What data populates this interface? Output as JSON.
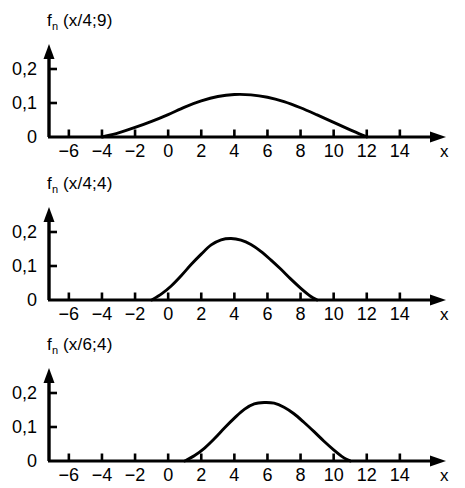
{
  "figure": {
    "background_color": "#ffffff",
    "ink_color": "#000000",
    "x_axis_name": "x",
    "panel_count": 3
  },
  "chart_data": [
    {
      "type": "line",
      "title": "f_n (x/4;9)",
      "title_base": "f",
      "title_sub": "n",
      "title_args": " (x/4;9)",
      "xlabel": "x",
      "ylabel": "",
      "xlim": [
        -7.2,
        15.6
      ],
      "ylim": [
        0,
        0.26
      ],
      "xticks": [
        -6,
        -4,
        -2,
        0,
        2,
        4,
        6,
        8,
        10,
        12,
        14
      ],
      "xtick_labels": [
        "−6",
        "−4",
        "−2",
        "0",
        "2",
        "4",
        "6",
        "8",
        "10",
        "12",
        "14"
      ],
      "yticks": [
        0,
        0.1,
        0.2
      ],
      "ytick_labels": [
        "0",
        "0,1",
        "0,2"
      ],
      "grid": false,
      "legend": "none",
      "peak_x": 4.2,
      "peak_y": 0.125,
      "support": [
        -4,
        12
      ],
      "x": [
        -4.0,
        -3.0,
        -2.0,
        -1.0,
        0.0,
        1.0,
        2.0,
        3.0,
        4.0,
        5.0,
        6.0,
        7.0,
        8.0,
        9.0,
        10.0,
        11.0,
        12.0
      ],
      "values": [
        0.0,
        0.012,
        0.028,
        0.046,
        0.066,
        0.088,
        0.106,
        0.119,
        0.125,
        0.124,
        0.117,
        0.104,
        0.086,
        0.065,
        0.043,
        0.021,
        0.0
      ]
    },
    {
      "type": "line",
      "title": "f_n (x/4;4)",
      "title_base": "f",
      "title_sub": "n",
      "title_args": " (x/4;4)",
      "xlabel": "x",
      "ylabel": "",
      "xlim": [
        -7.2,
        15.6
      ],
      "ylim": [
        0,
        0.26
      ],
      "xticks": [
        -6,
        -4,
        -2,
        0,
        2,
        4,
        6,
        8,
        10,
        12,
        14
      ],
      "xtick_labels": [
        "−6",
        "−4",
        "−2",
        "0",
        "2",
        "4",
        "6",
        "8",
        "10",
        "12",
        "14"
      ],
      "yticks": [
        0,
        0.1,
        0.2
      ],
      "ytick_labels": [
        "0",
        "0,1",
        "0,2"
      ],
      "grid": false,
      "legend": "none",
      "peak_x": 3.8,
      "peak_y": 0.181,
      "support": [
        -1,
        9
      ],
      "x": [
        -1.0,
        -0.4,
        0.2,
        0.8,
        1.4,
        2.0,
        2.6,
        3.2,
        3.8,
        4.4,
        5.0,
        5.6,
        6.2,
        6.8,
        7.4,
        8.0,
        8.6,
        9.0
      ],
      "values": [
        0.0,
        0.018,
        0.042,
        0.072,
        0.105,
        0.135,
        0.162,
        0.177,
        0.181,
        0.176,
        0.163,
        0.143,
        0.118,
        0.091,
        0.062,
        0.035,
        0.011,
        0.0
      ]
    },
    {
      "type": "line",
      "title": "f_n (x/6;4)",
      "title_base": "f",
      "title_sub": "n",
      "title_args": " (x/6;4)",
      "xlabel": "x",
      "ylabel": "",
      "xlim": [
        -7.2,
        15.6
      ],
      "ylim": [
        0,
        0.26
      ],
      "xticks": [
        -6,
        -4,
        -2,
        0,
        2,
        4,
        6,
        8,
        10,
        12,
        14
      ],
      "xtick_labels": [
        "−6",
        "−4",
        "−2",
        "0",
        "2",
        "4",
        "6",
        "8",
        "10",
        "12",
        "14"
      ],
      "yticks": [
        0,
        0.1,
        0.2
      ],
      "ytick_labels": [
        "0",
        "0,1",
        "0,2"
      ],
      "grid": false,
      "legend": "none",
      "peak_x": 6.0,
      "peak_y": 0.172,
      "support": [
        1,
        11
      ],
      "x": [
        1.0,
        1.6,
        2.2,
        2.8,
        3.4,
        4.0,
        4.6,
        5.2,
        5.8,
        6.4,
        7.0,
        7.6,
        8.2,
        8.8,
        9.4,
        10.0,
        10.6,
        11.0
      ],
      "values": [
        0.0,
        0.016,
        0.038,
        0.066,
        0.097,
        0.126,
        0.152,
        0.168,
        0.172,
        0.17,
        0.158,
        0.139,
        0.114,
        0.087,
        0.059,
        0.033,
        0.01,
        0.0
      ]
    }
  ]
}
